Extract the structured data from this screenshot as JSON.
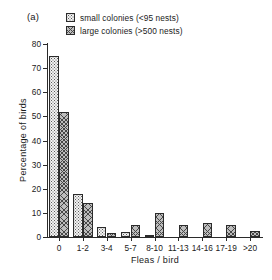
{
  "figure": {
    "panel_label": "(a)"
  },
  "legend": {
    "position": "top-center",
    "entries": [
      {
        "label": "small colonies (<95 nests)",
        "swatch": "light-stipple-swatch"
      },
      {
        "label": "large colonies (>500 nests)",
        "swatch": "dark-crosshatch-swatch"
      }
    ]
  },
  "chart_data": {
    "type": "bar",
    "title": "",
    "subtitle": "",
    "xlabel": "Fleas / bird",
    "ylabel": "Percentage of birds",
    "categories": [
      "0",
      "1-2",
      "3-4",
      "5-7",
      "8-10",
      "11-13",
      "14-16",
      "17-19",
      ">20"
    ],
    "series": [
      {
        "name": "small colonies (<95 nests)",
        "values": [
          75,
          18,
          4,
          2,
          1,
          0,
          0,
          0,
          0
        ]
      },
      {
        "name": "large colonies (>500 nests)",
        "values": [
          52,
          14,
          1.5,
          5,
          10,
          5,
          6,
          5,
          2.5
        ]
      }
    ],
    "ylim": [
      0,
      80
    ],
    "yticks": [
      0,
      10,
      20,
      30,
      40,
      50,
      60,
      70,
      80
    ],
    "ytick_labels": [
      "0",
      "10",
      "20",
      "30",
      "40",
      "50",
      "60",
      "70",
      "80"
    ],
    "grid": false,
    "legend_position": "top-center",
    "colors": {
      "axis": "#2b2b2b",
      "small_fill": "#f2f2f2",
      "large_fill": "#bdbdbd",
      "background": "#ffffff"
    }
  }
}
